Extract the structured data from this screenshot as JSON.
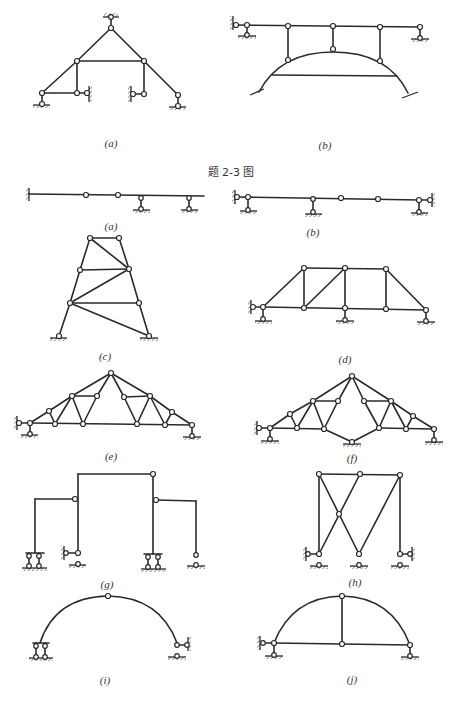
{
  "figure_caption": "题 2-3 图",
  "top_figures": [
    {
      "id": "a",
      "label": "(a)",
      "description": "Triangular frame with top hinge support, tie beam and two vertical posts, pin supports at both ends, sliding wall supports at inner ends"
    },
    {
      "id": "b",
      "label": "(b)",
      "description": "Horizontal beam on pin supports connected by three hinged posts to a fixed-end arch with tie"
    }
  ],
  "bottom_figures": [
    {
      "id": "a",
      "label": "(a)",
      "description": "Multi-span beam: fixed left end, two intermediate hinges, two roller supports"
    },
    {
      "id": "b",
      "label": "(b)",
      "description": "Multi-span beam with wall/roller supports at ends, roller support, two intermediate hinges"
    },
    {
      "id": "c",
      "label": "(c)",
      "description": "Tapered tower truss with diagonal bracing on two pin supports"
    },
    {
      "id": "d",
      "label": "(d)",
      "description": "Trapezoidal truss with three supports"
    },
    {
      "id": "e",
      "label": "(e)",
      "description": "Triangular roof truss with two supports"
    },
    {
      "id": "f",
      "label": "(f)",
      "description": "Roof truss with central bottom hinge support"
    },
    {
      "id": "g",
      "label": "(g)",
      "description": "Stepped portal frame with hinges on multiple supports"
    },
    {
      "id": "h",
      "label": "(h)",
      "description": "Frame with crossed diagonal members and three supports"
    },
    {
      "id": "i",
      "label": "(i)",
      "description": "Three-hinged style arch with crown hinge"
    },
    {
      "id": "j",
      "label": "(j)",
      "description": "Tied arch with central vertical hanger"
    }
  ],
  "labels": {
    "top_a": "(a)",
    "top_b": "(b)",
    "caption": "题 2-3 图",
    "a": "(a)",
    "b": "(b)",
    "c": "(c)",
    "d": "(d)",
    "e": "(e)",
    "f": "(f)",
    "g": "(g)",
    "h": "(h)",
    "i": "(i)",
    "j": "(j)"
  }
}
